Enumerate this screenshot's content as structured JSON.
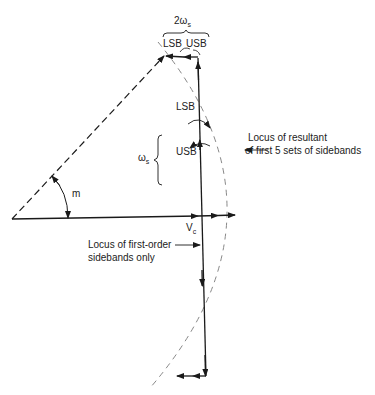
{
  "diagram": {
    "type": "phasor-diagram",
    "labels": {
      "top_bracket": "2ω",
      "top_bracket_sub": "s",
      "top_lsb": "LSB",
      "top_usb": "USB",
      "mid_lsb": "LSB",
      "mid_usb": "USB",
      "omega_s": "ω",
      "omega_s_sub": "s",
      "angle": "m",
      "carrier": "V",
      "carrier_sub": "c",
      "locus_resultant_line1": "Locus of resultant",
      "locus_resultant_line2": "of first 5 sets of sidebands",
      "locus_first_order_line1": "Locus of first-order",
      "locus_first_order_line2": "sidebands only"
    },
    "colors": {
      "ink": "#1a1a1a",
      "dashed_arc": "#888888",
      "background": "#ffffff"
    }
  }
}
